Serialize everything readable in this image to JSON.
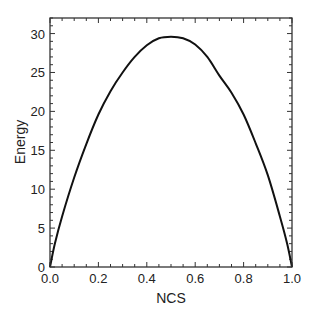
{
  "chart_data": {
    "type": "line",
    "title": "",
    "xlabel": "NCS",
    "ylabel": "Energy",
    "xlim": [
      0.0,
      1.0
    ],
    "ylim": [
      0,
      32
    ],
    "xticks": [
      0.0,
      0.2,
      0.4,
      0.6,
      0.8,
      1.0
    ],
    "xtick_labels": [
      "0.0",
      "0.2",
      "0.4",
      "0.6",
      "0.8",
      "1.0"
    ],
    "yticks": [
      0,
      5,
      10,
      15,
      20,
      25,
      30
    ],
    "ytick_labels": [
      "0",
      "5",
      "10",
      "15",
      "20",
      "25",
      "30"
    ],
    "x_minor_step": 0.05,
    "y_minor_step": 1,
    "grid": false,
    "legend": null,
    "series": [
      {
        "name": "Energy",
        "color": "#111111",
        "x": [
          0.0,
          0.02,
          0.05,
          0.1,
          0.15,
          0.2,
          0.25,
          0.3,
          0.35,
          0.4,
          0.45,
          0.5,
          0.55,
          0.6,
          0.65,
          0.7,
          0.75,
          0.8,
          0.85,
          0.9,
          0.95,
          0.98,
          1.0
        ],
        "y": [
          0.0,
          3.0,
          6.5,
          11.5,
          15.8,
          19.6,
          22.6,
          25.0,
          27.0,
          28.5,
          29.4,
          29.6,
          29.4,
          28.6,
          27.0,
          24.6,
          22.4,
          19.6,
          15.9,
          11.8,
          6.5,
          3.0,
          0.0
        ]
      }
    ]
  }
}
